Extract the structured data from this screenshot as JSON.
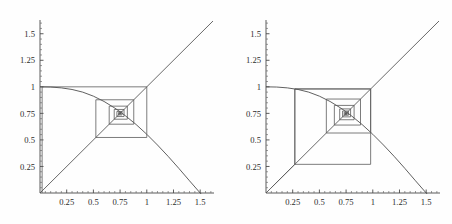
{
  "figure": {
    "title": "",
    "panel_count": 2,
    "background_color": "#fefefe",
    "line_color": "#4e4e4e"
  },
  "chart_data": [
    {
      "type": "line",
      "title": "",
      "subtitle": "Cobweb diagram, orbit spiralling inward to the fixed point",
      "xlabel": "",
      "ylabel": "",
      "xlim": [
        0,
        1.62
      ],
      "ylim": [
        0,
        1.62
      ],
      "grid": false,
      "legend": "none",
      "xticks": [
        0.25,
        0.5,
        0.75,
        1,
        1.25,
        1.5
      ],
      "xticklabels": [
        "0.25",
        "0.5",
        "0.75",
        "1",
        "1.25",
        "1.5"
      ],
      "yticks": [
        0.25,
        0.5,
        0.75,
        1,
        1.25,
        1.5
      ],
      "yticklabels": [
        "0.25",
        "0.5",
        "0.75",
        "1",
        "1.25",
        "1.5"
      ],
      "series": [
        {
          "name": "identity-line",
          "kind": "line",
          "x": [
            0,
            1.62
          ],
          "y": [
            0,
            1.62
          ]
        },
        {
          "name": "map-curve",
          "kind": "line",
          "x": [
            0.0,
            0.1,
            0.2,
            0.3,
            0.4,
            0.5,
            0.6,
            0.7,
            0.75,
            0.8,
            0.9,
            1.0,
            1.1,
            1.2,
            1.3,
            1.4,
            1.5,
            1.6
          ],
          "y": [
            1.0,
            0.998,
            0.99,
            0.975,
            0.95,
            0.912,
            0.862,
            0.8,
            0.765,
            0.727,
            0.645,
            0.553,
            0.452,
            0.345,
            0.232,
            0.115,
            0.0,
            -0.1
          ]
        },
        {
          "name": "cobweb-orbit",
          "kind": "staircase",
          "fixed_point": [
            0.75,
            0.75
          ],
          "start_x": 0.02,
          "vertices": [
            [
              0.02,
              0.0
            ],
            [
              0.02,
              1.0
            ],
            [
              1.0,
              1.0
            ],
            [
              1.0,
              0.523
            ],
            [
              0.523,
              0.523
            ],
            [
              0.523,
              0.878
            ],
            [
              0.878,
              0.878
            ],
            [
              0.878,
              0.648
            ],
            [
              0.648,
              0.648
            ],
            [
              0.648,
              0.818
            ],
            [
              0.818,
              0.818
            ],
            [
              0.818,
              0.695
            ],
            [
              0.695,
              0.695
            ],
            [
              0.695,
              0.787
            ],
            [
              0.787,
              0.787
            ],
            [
              0.787,
              0.72
            ],
            [
              0.72,
              0.72
            ],
            [
              0.72,
              0.768
            ],
            [
              0.768,
              0.768
            ],
            [
              0.768,
              0.735
            ],
            [
              0.735,
              0.735
            ],
            [
              0.735,
              0.758
            ],
            [
              0.758,
              0.758
            ],
            [
              0.758,
              0.743
            ],
            [
              0.743,
              0.743
            ],
            [
              0.743,
              0.753
            ],
            [
              0.753,
              0.753
            ],
            [
              0.753,
              0.747
            ],
            [
              0.747,
              0.747
            ],
            [
              0.747,
              0.751
            ],
            [
              0.751,
              0.751
            ],
            [
              0.751,
              0.749
            ],
            [
              0.749,
              0.749
            ]
          ]
        }
      ]
    },
    {
      "type": "line",
      "title": "",
      "subtitle": "Cobweb diagram, orbit spiralling inward from a different initial value",
      "xlabel": "",
      "ylabel": "",
      "xlim": [
        0,
        1.62
      ],
      "ylim": [
        0,
        1.62
      ],
      "grid": false,
      "legend": "none",
      "xticks": [
        0.25,
        0.5,
        0.75,
        1,
        1.25,
        1.5
      ],
      "xticklabels": [
        "0.25",
        "0.5",
        "0.75",
        "1",
        "1.25",
        "1.5"
      ],
      "yticks": [
        0.25,
        0.5,
        0.75,
        1,
        1.25,
        1.5
      ],
      "yticklabels": [
        "0.25",
        "0.5",
        "0.75",
        "1",
        "1.25",
        "1.5"
      ],
      "series": [
        {
          "name": "identity-line",
          "kind": "line",
          "x": [
            0,
            1.62
          ],
          "y": [
            0,
            1.62
          ]
        },
        {
          "name": "map-curve",
          "kind": "line",
          "x": [
            0.0,
            0.1,
            0.2,
            0.3,
            0.4,
            0.5,
            0.6,
            0.7,
            0.75,
            0.8,
            0.9,
            1.0,
            1.1,
            1.2,
            1.3,
            1.4,
            1.5,
            1.6
          ],
          "y": [
            1.0,
            0.998,
            0.99,
            0.975,
            0.95,
            0.912,
            0.862,
            0.8,
            0.765,
            0.727,
            0.645,
            0.553,
            0.452,
            0.345,
            0.232,
            0.115,
            0.0,
            -0.1
          ]
        },
        {
          "name": "cobweb-orbit",
          "kind": "staircase",
          "fixed_point": [
            0.75,
            0.75
          ],
          "start_x": 0.27,
          "vertices": [
            [
              0.05,
              0.05
            ],
            [
              0.27,
              0.27
            ],
            [
              0.27,
              0.98
            ],
            [
              0.98,
              0.98
            ],
            [
              0.98,
              0.27
            ],
            [
              0.27,
              0.27
            ],
            [
              0.27,
              0.98
            ],
            [
              0.98,
              0.98
            ],
            [
              0.98,
              0.565
            ],
            [
              0.565,
              0.565
            ],
            [
              0.565,
              0.885
            ],
            [
              0.885,
              0.885
            ],
            [
              0.885,
              0.64
            ],
            [
              0.64,
              0.64
            ],
            [
              0.64,
              0.825
            ],
            [
              0.825,
              0.825
            ],
            [
              0.825,
              0.69
            ],
            [
              0.69,
              0.69
            ],
            [
              0.69,
              0.792
            ],
            [
              0.792,
              0.792
            ],
            [
              0.792,
              0.717
            ],
            [
              0.717,
              0.717
            ],
            [
              0.717,
              0.772
            ],
            [
              0.772,
              0.772
            ],
            [
              0.772,
              0.732
            ],
            [
              0.732,
              0.732
            ],
            [
              0.732,
              0.761
            ],
            [
              0.761,
              0.761
            ],
            [
              0.761,
              0.74
            ],
            [
              0.74,
              0.74
            ],
            [
              0.74,
              0.755
            ],
            [
              0.755,
              0.755
            ],
            [
              0.755,
              0.744
            ],
            [
              0.744,
              0.744
            ],
            [
              0.744,
              0.752
            ],
            [
              0.752,
              0.752
            ],
            [
              0.752,
              0.746
            ],
            [
              0.746,
              0.746
            ],
            [
              0.746,
              0.751
            ],
            [
              0.751,
              0.751
            ],
            [
              0.751,
              0.748
            ],
            [
              0.748,
              0.748
            ]
          ]
        }
      ]
    }
  ],
  "panels": [
    {
      "name": "left-plot",
      "axes": {
        "x_tick_labels": [
          "0.25",
          "0.5",
          "0.75",
          "1",
          "1.25",
          "1.5"
        ],
        "y_tick_labels": [
          "0.25",
          "0.5",
          "0.75",
          "1",
          "1.25",
          "1.5"
        ]
      }
    },
    {
      "name": "right-plot",
      "axes": {
        "x_tick_labels": [
          "0.25",
          "0.5",
          "0.75",
          "1",
          "1.25",
          "1.5"
        ],
        "y_tick_labels": [
          "0.25",
          "0.5",
          "0.75",
          "1",
          "1.25",
          "1.5"
        ]
      }
    }
  ]
}
